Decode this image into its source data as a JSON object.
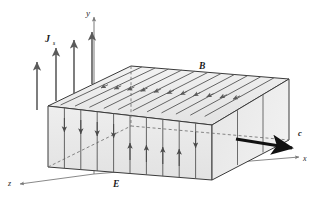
{
  "figure": {
    "background_color": "#ffffff"
  },
  "axes": {
    "y": {
      "label": "y",
      "position": "top-center"
    },
    "x": {
      "label": "x",
      "position": "bottom-right"
    },
    "z": {
      "label": "z",
      "position": "bottom-left"
    }
  },
  "field_labels": {
    "surface_current": {
      "symbol": "J",
      "subscript": "s",
      "description": "surface current density arrows pointing up (+y)"
    },
    "magnetic_field": {
      "symbol": "B",
      "description": "magnetic field arrows on top face pointing in -z direction"
    },
    "electric_field": {
      "symbol": "E",
      "description": "electric field arrows on front face, vertical"
    },
    "propagation": {
      "symbol": "c",
      "description": "wave propagation velocity arrow pointing +x"
    }
  },
  "colors": {
    "outline": "#3a3a3a",
    "face_light": "#f2f2f2",
    "face_mid": "#e8e8e8",
    "face_dark": "#dedede",
    "arrow": "#5a5a5a",
    "arrow_bold": "#111111",
    "axis": "#777777",
    "label_text": "#1a1a1a"
  },
  "geometry": {
    "slab_description": "rectangular parallelepiped in oblique projection",
    "front_face_divisions": 10,
    "top_face_field_lines": 10,
    "surface_current_arrow_count": 4
  }
}
